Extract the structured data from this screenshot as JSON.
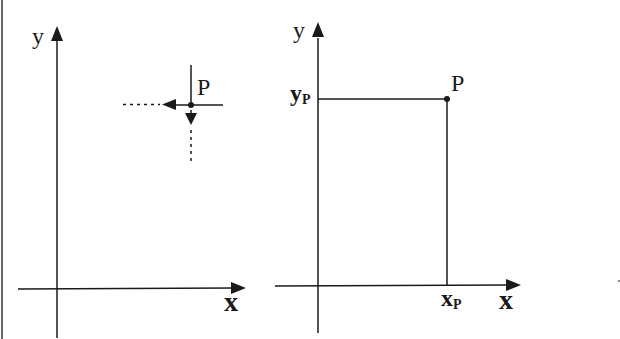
{
  "left_panel": {
    "x_axis_label": "x",
    "y_axis_label": "y",
    "point_label": "P",
    "description": "Point P with arrows pointing left (toward y-axis) and down (toward x-axis) along dashed projection lines"
  },
  "right_panel": {
    "x_axis_label": "x",
    "y_axis_label": "y",
    "point_label": "P",
    "x_coordinate_label": "x",
    "x_coordinate_subscript": "P",
    "y_coordinate_label": "y",
    "y_coordinate_subscript": "P",
    "description": "Point P projected onto axes giving coordinates xP and yP"
  },
  "colors": {
    "ink": "#1a1a1a",
    "background": "#ffffff",
    "border": "#555555"
  }
}
